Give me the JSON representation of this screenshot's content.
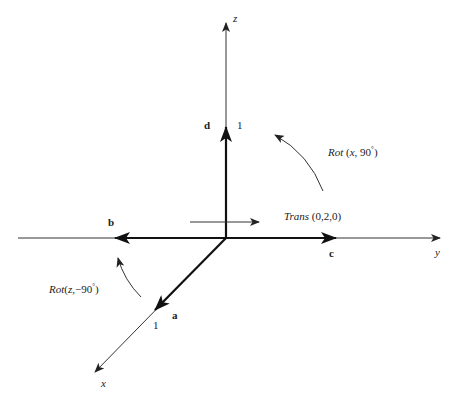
{
  "diagram": {
    "type": "3d-coordinate-frame-transform",
    "colors": {
      "ink": "#222222",
      "background": "#ffffff"
    },
    "axes": {
      "z": {
        "label": "z"
      },
      "y": {
        "label": "y"
      },
      "x": {
        "label": "x"
      }
    },
    "vectors": {
      "d": {
        "label": "d",
        "unit_label": "1"
      },
      "b": {
        "label": "b"
      },
      "c": {
        "label": "c"
      },
      "a": {
        "label": "a",
        "unit_label": "1"
      }
    },
    "transforms": {
      "trans": {
        "name": "Trans",
        "args": " (0,2,0)"
      },
      "rot_x": {
        "name": "Rot",
        "args_open": " (",
        "axis": "x",
        "sep": ", 90",
        "deg": "°",
        "close": ")"
      },
      "rot_z": {
        "name": "Rot",
        "args_open": "(",
        "axis": "z",
        "sep": ",−90",
        "deg": "°",
        "close": ")"
      }
    }
  }
}
